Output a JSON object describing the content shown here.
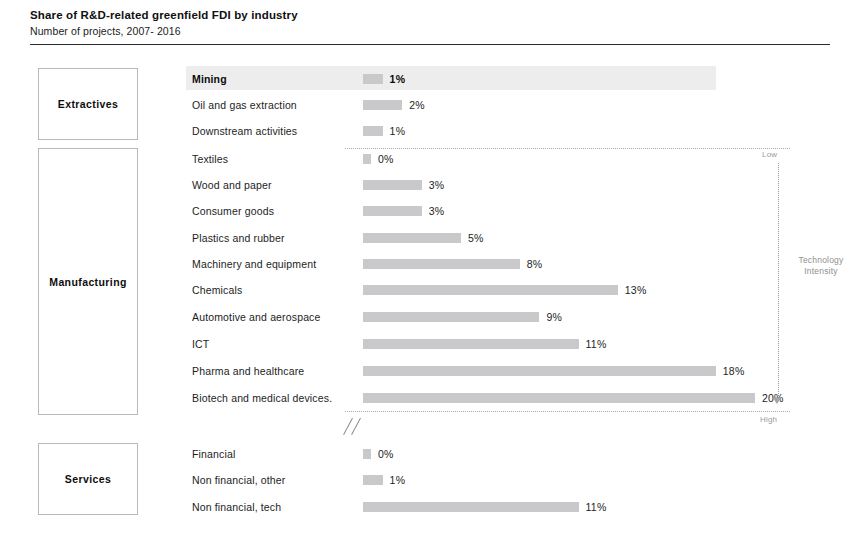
{
  "header": {
    "title": "Share of R&D-related greenfield FDI by industry",
    "subtitle": "Number of projects, 2007-  2016"
  },
  "categories": [
    {
      "label": "Extractives",
      "top": 68,
      "height": 72
    },
    {
      "label": "Manufacturing",
      "top": 148,
      "height": 267
    },
    {
      "label": "Services",
      "top": 443,
      "height": 72
    }
  ],
  "axis": {
    "title_line1": "Technology",
    "title_line2": "Intensity",
    "low_label": "Low",
    "high_label": "High",
    "break_symbol": "//"
  },
  "colors": {
    "bar": "#c9c9cb",
    "highlight_band": "#ededee",
    "rule": "#2c2c2c",
    "box_border": "#b9b9b9",
    "axis": "#9b9b9b"
  },
  "chart_data": {
    "type": "bar",
    "title": "Share of R&D-related greenfield FDI by industry",
    "subtitle": "Number of projects, 2007-  2016",
    "orientation": "horizontal",
    "xlabel": "",
    "ylabel": "",
    "unit": "%",
    "xlim": [
      0,
      20
    ],
    "grid": false,
    "legend": false,
    "value_labels": true,
    "sorted_by": "technology intensity (low to high)",
    "groups": [
      "Extractives",
      "Manufacturing",
      "Services"
    ],
    "categories": [
      "Mining",
      "Oil and gas extraction",
      "Downstream activities",
      "Textiles",
      "Wood and paper",
      "Consumer goods",
      "Plastics and rubber",
      "Machinery and equipment",
      "Chemicals",
      "Automotive and aerospace",
      "ICT",
      "Pharma and healthcare",
      "Biotech and medical devices.",
      "Financial",
      "Non financial, other",
      "Non financial, tech"
    ],
    "values": [
      1,
      2,
      1,
      0,
      3,
      3,
      5,
      8,
      13,
      9,
      11,
      18,
      20,
      0,
      1,
      11
    ],
    "labels": [
      "1%",
      "2%",
      "1%",
      "0%",
      "3%",
      "3%",
      "5%",
      "8%",
      "13%",
      "9%",
      "11%",
      "18%",
      "20%",
      "0%",
      "1%",
      "11%"
    ]
  },
  "rows": [
    {
      "label": "Mining",
      "value": 1,
      "text": "1%",
      "group": "Extractives",
      "top": 66,
      "highlight": true
    },
    {
      "label": "Oil and gas extraction",
      "value": 2,
      "text": "2%",
      "group": "Extractives",
      "top": 92,
      "highlight": false
    },
    {
      "label": "Downstream activities",
      "value": 1,
      "text": "1%",
      "group": "Extractives",
      "top": 118,
      "highlight": false
    },
    {
      "label": "Textiles",
      "value": 0,
      "text": "0%",
      "group": "Manufacturing",
      "top": 146,
      "highlight": false
    },
    {
      "label": "Wood and paper",
      "value": 3,
      "text": "3%",
      "group": "Manufacturing",
      "top": 172,
      "highlight": false
    },
    {
      "label": "Consumer goods",
      "value": 3,
      "text": "3%",
      "group": "Manufacturing",
      "top": 198,
      "highlight": false
    },
    {
      "label": "Plastics and rubber",
      "value": 5,
      "text": "5%",
      "group": "Manufacturing",
      "top": 225,
      "highlight": false
    },
    {
      "label": "Machinery and equipment",
      "value": 8,
      "text": "8%",
      "group": "Manufacturing",
      "top": 251,
      "highlight": false
    },
    {
      "label": "Chemicals",
      "value": 13,
      "text": "13%",
      "group": "Manufacturing",
      "top": 277,
      "highlight": false
    },
    {
      "label": "Automotive and aerospace",
      "value": 9,
      "text": "9%",
      "group": "Manufacturing",
      "top": 304,
      "highlight": false
    },
    {
      "label": "ICT",
      "value": 11,
      "text": "11%",
      "group": "Manufacturing",
      "top": 331,
      "highlight": false
    },
    {
      "label": "Pharma and healthcare",
      "value": 18,
      "text": "18%",
      "group": "Manufacturing",
      "top": 358,
      "highlight": false
    },
    {
      "label": "Biotech and medical devices.",
      "value": 20,
      "text": "20%",
      "group": "Manufacturing",
      "top": 385,
      "highlight": false
    },
    {
      "label": "Financial",
      "value": 0,
      "text": "0%",
      "group": "Services",
      "top": 441,
      "highlight": false
    },
    {
      "label": "Non financial, other",
      "value": 1,
      "text": "1%",
      "group": "Services",
      "top": 467,
      "highlight": false
    },
    {
      "label": "Non financial, tech",
      "value": 11,
      "text": "11%",
      "group": "Services",
      "top": 494,
      "highlight": false
    }
  ],
  "dotted_lines": [
    {
      "top": 148
    },
    {
      "top": 411
    }
  ]
}
